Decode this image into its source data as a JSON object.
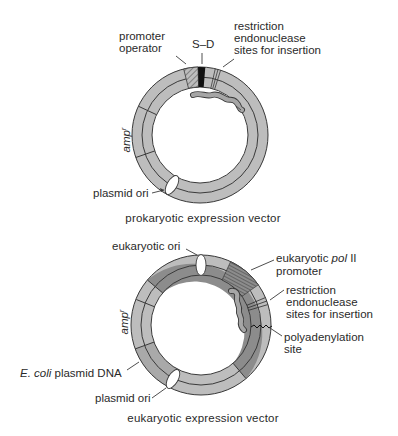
{
  "figure": {
    "colors": {
      "light_segment": "#bdbdbd",
      "dark_segment": "#8c8c8c",
      "coli_segment": "#a9a9a9",
      "outline": "#3a3a3a",
      "sd_box": "#111111",
      "insert": "#9a9a9a"
    },
    "prokaryotic": {
      "caption": "prokaryotic expression vector",
      "labels": {
        "promoter": "promoter",
        "operator": "operator",
        "sd": "S–D",
        "restriction_1": "restriction",
        "restriction_2": "endonuclease",
        "restriction_3": "sites for insertion",
        "amp": "amp",
        "amp_sup": "r",
        "ori": "plasmid ori"
      }
    },
    "eukaryotic": {
      "caption": "eukaryotic expression vector",
      "labels": {
        "euk_ori": "eukaryotic ori",
        "pol_1": "eukaryotic ",
        "pol_italic": "pol",
        "pol_2": " II",
        "pol_3": "promoter",
        "restriction_1": "restriction",
        "restriction_2": "endonuclease",
        "restriction_3": "sites for insertion",
        "polya_1": "polyadenylation",
        "polya_2": "site",
        "amp": "amp",
        "amp_sup": "r",
        "ecoli_italic": "E. coli",
        "ecoli_rest": " plasmid DNA",
        "ori": "plasmid ori"
      }
    }
  }
}
